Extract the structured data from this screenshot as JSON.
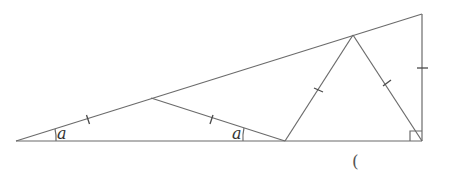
{
  "figure": {
    "points": {
      "A": [
        16,
        141
      ],
      "P": [
        151,
        98
      ],
      "Q": [
        285,
        141
      ],
      "R": [
        353,
        35
      ],
      "T": [
        422,
        14
      ],
      "C": [
        422,
        141
      ]
    },
    "angle_labels": [
      {
        "text": "a",
        "at": "A",
        "x": 57,
        "y": 139
      },
      {
        "text": "a",
        "at": "Q",
        "x": 232,
        "y": 139
      }
    ],
    "right_angle_at": "C",
    "answer_bracket": "(",
    "colors": {
      "line": "#6b6b6b",
      "text": "#333333"
    }
  }
}
